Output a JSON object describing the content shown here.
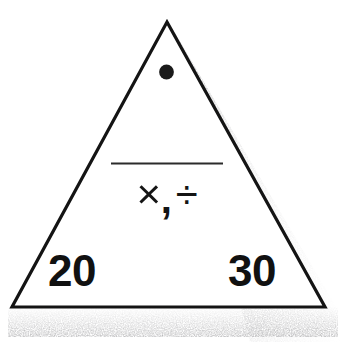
{
  "card": {
    "shape": "triangle",
    "background_color": "#ffffff",
    "outline_color": "#111111",
    "shadow": "stippled-drop-shadow-right-and-bottom"
  },
  "apex": {
    "marker_icon": "filled-dot-icon",
    "marker_color": "#1a1a1a"
  },
  "center": {
    "divider": "horizontal-rule",
    "operators": {
      "multiply": "×",
      "separator": ",",
      "divide": "÷",
      "combined": "×, ÷"
    }
  },
  "corners": {
    "bottom_left": "20",
    "bottom_right": "30"
  }
}
